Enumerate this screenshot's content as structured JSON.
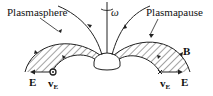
{
  "labels": {
    "plasmasphere": "Plasmasphere",
    "plasmapause": "Plasmapause",
    "omega": "ω",
    "b_field": "B",
    "e_left": "E",
    "e_right": "E",
    "ve_left": "v",
    "ve_left_sub": "E",
    "ve_right": "v",
    "ve_right_sub": "E"
  },
  "colors": {
    "stroke": "#222222",
    "background": "#ffffff"
  }
}
